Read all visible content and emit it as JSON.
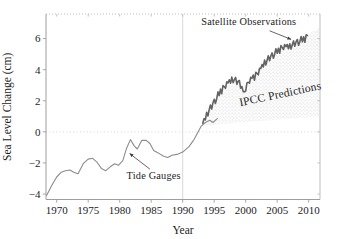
{
  "figure": {
    "background": "#ffffff"
  },
  "chart_data": {
    "type": "line",
    "title": "",
    "xlabel": "Year",
    "ylabel": "Sea Level Change (cm)",
    "xlim": [
      1968.3,
      2011.8
    ],
    "ylim": [
      -4.35,
      7.58
    ],
    "x_ticks": [
      1970,
      1975,
      1980,
      1985,
      1990,
      1995,
      2000,
      2005,
      2010
    ],
    "y_ticks": [
      -4,
      -2,
      0,
      2,
      4,
      6
    ],
    "grid": "dotted horizontal line at y=0; faint vertical reference line at x=1990; dotted top frame edge",
    "legend_position": "none (direct labels with arrows)",
    "colors": {
      "tide_gauges_line": "#8c8c8c",
      "satellite_line": "#636363",
      "ipcc_band_dots": "#bdbdbd",
      "frame": "#9e9e9e",
      "frame_light": "#b8b8b8",
      "zero_gridline": "#cfcfcf",
      "ref_1990_line": "#d4d4d4",
      "text": "#1c1c1c",
      "arrow": "#3d3d3d"
    },
    "reference_lines": [
      {
        "axis": "x",
        "value": 1990,
        "style": "solid-light"
      },
      {
        "axis": "y",
        "value": 0,
        "style": "dotted"
      }
    ],
    "series": [
      {
        "name": "Tide Gauges",
        "type": "line",
        "color": "#8c8c8c",
        "width": 1.1,
        "points": [
          [
            1968.4,
            -4.1
          ],
          [
            1969.2,
            -3.45
          ],
          [
            1970.0,
            -2.9
          ],
          [
            1970.7,
            -2.6
          ],
          [
            1971.4,
            -2.5
          ],
          [
            1972.1,
            -2.45
          ],
          [
            1972.7,
            -2.6
          ],
          [
            1973.4,
            -2.7
          ],
          [
            1974.2,
            -2.05
          ],
          [
            1975.0,
            -1.75
          ],
          [
            1975.7,
            -1.7
          ],
          [
            1976.4,
            -1.95
          ],
          [
            1977.1,
            -2.35
          ],
          [
            1977.8,
            -2.5
          ],
          [
            1978.5,
            -2.25
          ],
          [
            1979.2,
            -2.05
          ],
          [
            1979.8,
            -2.15
          ],
          [
            1980.5,
            -1.85
          ],
          [
            1981.1,
            -1.05
          ],
          [
            1981.7,
            -0.5
          ],
          [
            1982.3,
            -0.9
          ],
          [
            1982.8,
            -1.1
          ],
          [
            1983.5,
            -0.55
          ],
          [
            1984.2,
            -0.55
          ],
          [
            1984.8,
            -0.75
          ],
          [
            1985.4,
            -1.2
          ],
          [
            1986.1,
            -1.35
          ],
          [
            1986.9,
            -1.55
          ],
          [
            1987.6,
            -1.65
          ],
          [
            1988.3,
            -1.5
          ],
          [
            1989.1,
            -1.45
          ],
          [
            1990.0,
            -1.3
          ],
          [
            1991.0,
            -0.95
          ],
          [
            1991.8,
            -0.5
          ],
          [
            1992.4,
            -0.05
          ],
          [
            1992.9,
            0.35
          ],
          [
            1993.6,
            0.6
          ],
          [
            1994.3,
            0.75
          ],
          [
            1994.8,
            0.6
          ],
          [
            1995.5,
            0.85
          ]
        ]
      },
      {
        "name": "Satellite Observations",
        "type": "line",
        "color": "#636363",
        "width": 1.6,
        "points": [
          [
            1993.2,
            0.55
          ],
          [
            1993.4,
            0.86
          ],
          [
            1993.6,
            0.76
          ],
          [
            1993.8,
            1.26
          ],
          [
            1994.0,
            1.02
          ],
          [
            1994.2,
            1.39
          ],
          [
            1994.4,
            1.73
          ],
          [
            1994.6,
            1.47
          ],
          [
            1994.8,
            1.86
          ],
          [
            1995.0,
            2.1
          ],
          [
            1995.2,
            1.82
          ],
          [
            1995.4,
            2.13
          ],
          [
            1995.6,
            2.57
          ],
          [
            1995.8,
            2.34
          ],
          [
            1996.0,
            2.75
          ],
          [
            1996.2,
            2.45
          ],
          [
            1996.4,
            2.98
          ],
          [
            1996.6,
            2.9
          ],
          [
            1996.8,
            2.8
          ],
          [
            1997.0,
            3.22
          ],
          [
            1997.2,
            3.15
          ],
          [
            1997.4,
            3.35
          ],
          [
            1997.6,
            3.13
          ],
          [
            1997.8,
            3.52
          ],
          [
            1998.0,
            3.17
          ],
          [
            1998.2,
            3.35
          ],
          [
            1998.4,
            3.5
          ],
          [
            1998.6,
            3.05
          ],
          [
            1998.8,
            3.25
          ],
          [
            1999.0,
            3.3
          ],
          [
            1999.2,
            2.81
          ],
          [
            1999.4,
            2.91
          ],
          [
            1999.6,
            2.59
          ],
          [
            1999.8,
            2.57
          ],
          [
            2000.0,
            2.63
          ],
          [
            2000.2,
            3.15
          ],
          [
            2000.4,
            3.19
          ],
          [
            2000.6,
            3.13
          ],
          [
            2000.8,
            3.51
          ],
          [
            2001.0,
            3.45
          ],
          [
            2001.2,
            3.66
          ],
          [
            2001.4,
            3.32
          ],
          [
            2001.6,
            3.83
          ],
          [
            2001.8,
            3.76
          ],
          [
            2002.0,
            3.67
          ],
          [
            2002.2,
            4.09
          ],
          [
            2002.4,
            4.08
          ],
          [
            2002.6,
            4.34
          ],
          [
            2002.8,
            4.17
          ],
          [
            2003.0,
            4.62
          ],
          [
            2003.2,
            4.3
          ],
          [
            2003.4,
            4.61
          ],
          [
            2003.6,
            4.89
          ],
          [
            2003.8,
            4.57
          ],
          [
            2004.0,
            4.9
          ],
          [
            2004.2,
            5.08
          ],
          [
            2004.4,
            4.74
          ],
          [
            2004.6,
            4.98
          ],
          [
            2004.8,
            5.35
          ],
          [
            2005.0,
            5.05
          ],
          [
            2005.2,
            5.38
          ],
          [
            2005.4,
            5.05
          ],
          [
            2005.6,
            5.55
          ],
          [
            2005.8,
            5.43
          ],
          [
            2006.0,
            5.3
          ],
          [
            2006.2,
            5.61
          ],
          [
            2006.4,
            5.48
          ],
          [
            2006.6,
            5.62
          ],
          [
            2006.8,
            5.34
          ],
          [
            2007.0,
            5.67
          ],
          [
            2007.2,
            5.32
          ],
          [
            2007.4,
            5.6
          ],
          [
            2007.6,
            5.85
          ],
          [
            2007.8,
            5.5
          ],
          [
            2008.0,
            5.8
          ],
          [
            2008.2,
            5.94
          ],
          [
            2008.4,
            5.57
          ],
          [
            2008.6,
            5.78
          ],
          [
            2008.8,
            6.13
          ],
          [
            2009.0,
            5.8
          ],
          [
            2009.2,
            6.12
          ],
          [
            2009.4,
            5.76
          ],
          [
            2009.6,
            6.24
          ],
          [
            2009.8,
            6.2
          ]
        ]
      },
      {
        "name": "IPCC Predictions",
        "type": "band",
        "fill_dot_color": "#bdbdbd",
        "upper": [
          [
            1993.0,
            0.5
          ],
          [
            1994.0,
            1.25
          ],
          [
            1995.0,
            2.0
          ],
          [
            1996.0,
            2.7
          ],
          [
            1997.0,
            3.25
          ],
          [
            1998.0,
            3.5
          ],
          [
            1999.0,
            3.2
          ],
          [
            2000.0,
            2.9
          ],
          [
            2000.5,
            3.4
          ],
          [
            2001.5,
            3.75
          ],
          [
            2003.0,
            4.55
          ],
          [
            2004.5,
            5.15
          ],
          [
            2006.0,
            5.65
          ],
          [
            2007.0,
            5.6
          ],
          [
            2008.0,
            5.85
          ],
          [
            2009.8,
            6.3
          ],
          [
            2011.7,
            6.65
          ]
        ],
        "lower": [
          [
            1993.0,
            0.4
          ],
          [
            2011.7,
            1.0
          ]
        ]
      }
    ],
    "annotations": [
      {
        "id": "satellite-observations-label",
        "text": "Satellite Observations",
        "x": 2000.5,
        "y": 6.9,
        "rotation": 0,
        "arrow": {
          "from": [
            2003.8,
            6.5
          ],
          "to": [
            2007.2,
            5.95
          ]
        }
      },
      {
        "id": "tide-gauges-label",
        "text": "Tide Gauges",
        "x": 1985.4,
        "y": -3.0,
        "rotation": 0,
        "arrow": {
          "from": [
            1984.8,
            -2.4
          ],
          "to": [
            1981.6,
            -1.4
          ]
        }
      },
      {
        "id": "ipcc-predictions-label",
        "text": "IPCC Predictions",
        "x": 2005.6,
        "y": 2.2,
        "rotation": -12,
        "arrow": null
      }
    ]
  }
}
